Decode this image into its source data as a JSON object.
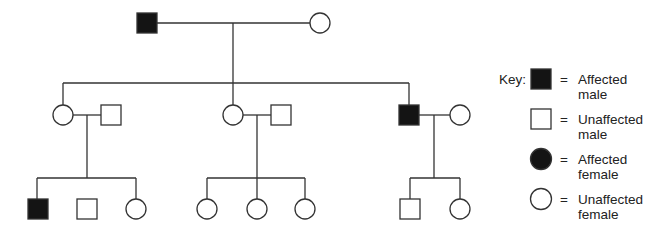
{
  "diagram": {
    "type": "pedigree",
    "generations": [
      {
        "gen": "I",
        "individuals": [
          {
            "id": "I-1",
            "sex": "male",
            "affected": true
          },
          {
            "id": "I-2",
            "sex": "female",
            "affected": false
          }
        ]
      },
      {
        "gen": "II",
        "individuals": [
          {
            "id": "II-1",
            "sex": "female",
            "affected": false,
            "spouse": "II-1s"
          },
          {
            "id": "II-1s",
            "sex": "male",
            "affected": false
          },
          {
            "id": "II-2",
            "sex": "female",
            "affected": false,
            "spouse": "II-2s"
          },
          {
            "id": "II-2s",
            "sex": "male",
            "affected": false
          },
          {
            "id": "II-3",
            "sex": "male",
            "affected": true,
            "spouse": "II-3s"
          },
          {
            "id": "II-3s",
            "sex": "female",
            "affected": false
          }
        ]
      },
      {
        "gen": "III",
        "individuals": [
          {
            "id": "III-1",
            "sex": "male",
            "affected": true
          },
          {
            "id": "III-2",
            "sex": "male",
            "affected": false
          },
          {
            "id": "III-3",
            "sex": "female",
            "affected": false
          },
          {
            "id": "III-4",
            "sex": "female",
            "affected": false
          },
          {
            "id": "III-5",
            "sex": "female",
            "affected": false
          },
          {
            "id": "III-6",
            "sex": "female",
            "affected": false
          },
          {
            "id": "III-7",
            "sex": "male",
            "affected": false
          },
          {
            "id": "III-8",
            "sex": "female",
            "affected": false
          }
        ]
      }
    ]
  },
  "key": {
    "title": "Key:",
    "equals": "=",
    "items": [
      {
        "line1": "Affected",
        "line2": "male"
      },
      {
        "line1": "Unaffected",
        "line2": "male"
      },
      {
        "line1": "Affected",
        "line2": "female"
      },
      {
        "line1": "Unaffected",
        "line2": "female"
      }
    ]
  },
  "colors": {
    "affected": "#141414",
    "line": "#333333"
  }
}
